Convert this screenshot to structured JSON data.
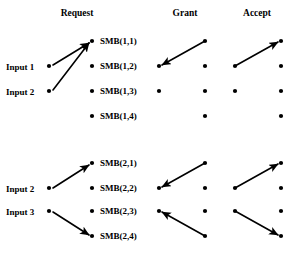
{
  "figure": {
    "title": "",
    "background_color": "#ffffff",
    "ink_color": "#000000",
    "width": 302,
    "height": 260
  },
  "columns": [
    {
      "id": "request",
      "label": "Request",
      "x": 77,
      "y": 16
    },
    {
      "id": "grant",
      "label": "Grant",
      "x": 185,
      "y": 16
    },
    {
      "id": "accept",
      "label": "Accept",
      "x": 257,
      "y": 16
    }
  ],
  "blocks": [
    {
      "id": "block-1",
      "inputs": [
        {
          "id": "input-1",
          "label": "Input 1",
          "text_x": 6,
          "text_y": 70,
          "dot_x": 49,
          "dot_y": 66
        },
        {
          "id": "input-2",
          "label": "Input 2",
          "text_x": 6,
          "text_y": 95,
          "dot_x": 49,
          "dot_y": 91
        }
      ],
      "request_nodes": [
        {
          "id": "smb-1-1",
          "label": "SMB(1,1)",
          "dot_x": 92,
          "dot_y": 41,
          "text_x": 100,
          "text_y": 44
        },
        {
          "id": "smb-1-2",
          "label": "SMB(1,2)",
          "dot_x": 92,
          "dot_y": 66,
          "text_x": 100,
          "text_y": 69
        },
        {
          "id": "smb-1-3",
          "label": "SMB(1,3)",
          "dot_x": 92,
          "dot_y": 91,
          "text_x": 100,
          "text_y": 94
        },
        {
          "id": "smb-1-4",
          "label": "SMB(1,4)",
          "dot_x": 92,
          "dot_y": 116,
          "text_x": 100,
          "text_y": 119
        }
      ],
      "grant_dots": [
        {
          "id": "grant-1-r2c1",
          "x": 159,
          "y": 66
        },
        {
          "id": "grant-1-r3c1",
          "x": 159,
          "y": 91
        },
        {
          "id": "grant-1-r1c2",
          "x": 205,
          "y": 41
        },
        {
          "id": "grant-1-r2c2",
          "x": 205,
          "y": 66
        },
        {
          "id": "grant-1-r3c2",
          "x": 205,
          "y": 91
        },
        {
          "id": "grant-1-r4c2",
          "x": 205,
          "y": 116
        }
      ],
      "accept_dots": [
        {
          "id": "accept-1-r2c1",
          "x": 235,
          "y": 66
        },
        {
          "id": "accept-1-r3c1",
          "x": 235,
          "y": 91
        },
        {
          "id": "accept-1-r1c2",
          "x": 281,
          "y": 41
        },
        {
          "id": "accept-1-r2c2",
          "x": 281,
          "y": 66
        },
        {
          "id": "accept-1-r3c2",
          "x": 281,
          "y": 91
        },
        {
          "id": "accept-1-r4c2",
          "x": 281,
          "y": 116
        }
      ],
      "arrows": [
        {
          "id": "arrow-in1-smb11",
          "group": "request",
          "x1": 53,
          "y1": 65,
          "x2": 89,
          "y2": 43
        },
        {
          "id": "arrow-in2-smb11",
          "group": "request",
          "x1": 53,
          "y1": 90,
          "x2": 89,
          "y2": 43
        },
        {
          "id": "arrow-grant-1",
          "group": "grant",
          "x1": 205,
          "y1": 41,
          "x2": 162,
          "y2": 65
        },
        {
          "id": "arrow-accept-1",
          "group": "accept",
          "x1": 235,
          "y1": 66,
          "x2": 278,
          "y2": 42
        }
      ]
    },
    {
      "id": "block-2",
      "inputs": [
        {
          "id": "input-2b",
          "label": "Input 2",
          "text_x": 6,
          "text_y": 192,
          "dot_x": 49,
          "dot_y": 188
        },
        {
          "id": "input-3",
          "label": "Input 3",
          "text_x": 6,
          "text_y": 215,
          "dot_x": 49,
          "dot_y": 211
        }
      ],
      "request_nodes": [
        {
          "id": "smb-2-1",
          "label": "SMB(2,1)",
          "dot_x": 92,
          "dot_y": 163,
          "text_x": 100,
          "text_y": 166
        },
        {
          "id": "smb-2-2",
          "label": "SMB(2,2)",
          "dot_x": 92,
          "dot_y": 188,
          "text_x": 100,
          "text_y": 191
        },
        {
          "id": "smb-2-3",
          "label": "SMB(2,3)",
          "dot_x": 92,
          "dot_y": 211,
          "text_x": 100,
          "text_y": 214
        },
        {
          "id": "smb-2-4",
          "label": "SMB(2,4)",
          "dot_x": 92,
          "dot_y": 236,
          "text_x": 100,
          "text_y": 239
        }
      ],
      "grant_dots": [
        {
          "id": "grant-2-r2c1",
          "x": 159,
          "y": 188
        },
        {
          "id": "grant-2-r3c1",
          "x": 159,
          "y": 211
        },
        {
          "id": "grant-2-r1c2",
          "x": 205,
          "y": 163
        },
        {
          "id": "grant-2-r2c2",
          "x": 205,
          "y": 188
        },
        {
          "id": "grant-2-r3c2",
          "x": 205,
          "y": 211
        },
        {
          "id": "grant-2-r4c2",
          "x": 205,
          "y": 236
        }
      ],
      "accept_dots": [
        {
          "id": "accept-2-r2c1",
          "x": 235,
          "y": 188
        },
        {
          "id": "accept-2-r3c1",
          "x": 235,
          "y": 211
        },
        {
          "id": "accept-2-r1c2",
          "x": 281,
          "y": 163
        },
        {
          "id": "accept-2-r2c2",
          "x": 281,
          "y": 188
        },
        {
          "id": "accept-2-r3c2",
          "x": 281,
          "y": 211
        },
        {
          "id": "accept-2-r4c2",
          "x": 281,
          "y": 236
        }
      ],
      "arrows": [
        {
          "id": "arrow-in2b-smb21",
          "group": "request",
          "x1": 53,
          "y1": 188,
          "x2": 89,
          "y2": 165
        },
        {
          "id": "arrow-in3-smb24",
          "group": "request",
          "x1": 53,
          "y1": 212,
          "x2": 89,
          "y2": 235
        },
        {
          "id": "arrow-grant-2a",
          "group": "grant",
          "x1": 205,
          "y1": 163,
          "x2": 162,
          "y2": 187
        },
        {
          "id": "arrow-grant-2b",
          "group": "grant",
          "x1": 205,
          "y1": 236,
          "x2": 162,
          "y2": 212
        },
        {
          "id": "arrow-accept-2a",
          "group": "accept",
          "x1": 235,
          "y1": 188,
          "x2": 278,
          "y2": 164
        },
        {
          "id": "arrow-accept-2b",
          "group": "accept",
          "x1": 235,
          "y1": 211,
          "x2": 278,
          "y2": 235
        }
      ]
    }
  ]
}
